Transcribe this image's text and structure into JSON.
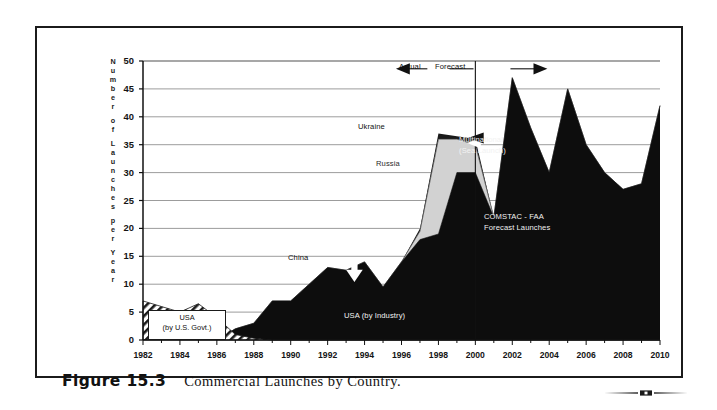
{
  "figure": {
    "number": "Figure 15.3",
    "caption": "Commercial Launches by Country."
  },
  "colors": {
    "ink": "#111111",
    "usa_industry": "#0d0d0d",
    "russia": "#d2d2d2",
    "ukraine": "#1a1a1a",
    "usa_government_hatch": "#ffffff",
    "grid": "#8a8a8a",
    "axis": "#111111"
  },
  "chart_data": {
    "type": "area",
    "title": "Commercial Launches by Country",
    "xlabel": "",
    "ylabel": "Number of Launches per Year",
    "ylabel_letters": [
      "N",
      "u",
      "m",
      "b",
      "e",
      "r",
      "",
      "o",
      "f",
      "",
      "L",
      "a",
      "u",
      "n",
      "c",
      "h",
      "e",
      "s",
      "",
      "p",
      "e",
      "r",
      "",
      "Y",
      "e",
      "a",
      "r"
    ],
    "ylim": [
      0,
      50
    ],
    "yticks": [
      0,
      5,
      10,
      15,
      20,
      25,
      30,
      35,
      40,
      45,
      50
    ],
    "xlim": [
      1982,
      2010
    ],
    "xticks": [
      1982,
      1984,
      1986,
      1988,
      1990,
      1992,
      1994,
      1996,
      1998,
      2000,
      2002,
      2004,
      2006,
      2008,
      2010
    ],
    "grid": true,
    "legend_position": "inline-annotations",
    "x": [
      1982,
      1983,
      1984,
      1985,
      1986,
      1987,
      1988,
      1989,
      1990,
      1991,
      1992,
      1993,
      1994,
      1995,
      1996,
      1997,
      1998,
      1999,
      2000,
      2001,
      2002,
      2003,
      2004,
      2005,
      2006,
      2007,
      2008,
      2009,
      2010
    ],
    "series": [
      {
        "name": "USA (by U.S. Govt.)",
        "style": "diagonal-hatch",
        "values": [
          7,
          6,
          5,
          6.5,
          4,
          1,
          0.3,
          0,
          0,
          0,
          0,
          0,
          0,
          0,
          0,
          0,
          0,
          0,
          0,
          0,
          0,
          0,
          0,
          0,
          0,
          0,
          0,
          0,
          0
        ]
      },
      {
        "name": "USA (by Industry)",
        "style": "solid-black",
        "values": [
          2,
          4,
          4,
          3.5,
          0,
          2,
          3,
          7,
          7,
          10,
          13,
          12.5,
          14,
          9.5,
          14,
          18,
          19,
          30,
          30,
          22,
          47,
          38,
          30,
          45,
          35,
          30,
          27,
          28,
          42
        ]
      },
      {
        "name": "Russia",
        "style": "solid-light-gray",
        "values": [
          0,
          0,
          0,
          0,
          0,
          0,
          0,
          0,
          0,
          0,
          0,
          0,
          0,
          0,
          0,
          1.5,
          17,
          6,
          5,
          0,
          0,
          0,
          0,
          0,
          0,
          0,
          0,
          0,
          0
        ]
      },
      {
        "name": "Ukraine",
        "style": "solid-dark",
        "values": [
          0,
          0,
          0,
          0,
          0,
          0,
          0,
          0,
          0,
          0,
          0,
          0,
          0,
          0,
          0,
          0.5,
          1,
          0.5,
          1,
          0,
          0,
          0,
          0,
          0,
          0,
          0,
          0,
          0,
          0
        ]
      }
    ],
    "stacked_totals": [
      9,
      10,
      9,
      10,
      4,
      3,
      3.3,
      7,
      7,
      10,
      13,
      12.5,
      14,
      9.5,
      14,
      20,
      37,
      36.5,
      36,
      22,
      47,
      38,
      30,
      45,
      35,
      30,
      27,
      28,
      42
    ],
    "annotations": [
      {
        "name": "actual-label",
        "text": "Actual",
        "x": 1997.6,
        "y": 48.6,
        "arrow": "left"
      },
      {
        "name": "forecast-label",
        "text": "Forecast",
        "x": 2000.3,
        "y": 48.6,
        "arrow": "right"
      },
      {
        "name": "divider-2000",
        "text": "",
        "x": 2000,
        "y": 50,
        "kind": "vertical-divider"
      },
      {
        "name": "ukraine-label",
        "text": "Ukraine",
        "x": 1996.7,
        "y": 40.2
      },
      {
        "name": "russia-label",
        "text": "Russia",
        "x": 1998.0,
        "y": 33.0
      },
      {
        "name": "china-label",
        "text": "China",
        "x": 1993.3,
        "y": 14.8,
        "arrow": "down"
      },
      {
        "name": "usa-industry-label",
        "text": "USA (by Industry)",
        "x": 1995.2,
        "y": 5.0
      },
      {
        "name": "usa-gov-label",
        "text": "USA",
        "text2": "(by U.S. Govt.)",
        "x": 1984.0,
        "y": 3.4
      },
      {
        "name": "multinational-label",
        "text": "Multinational",
        "text2": "(Sea Launch)",
        "x": 2000.9,
        "y": 35.4,
        "arrow": "left"
      },
      {
        "name": "comstac-label",
        "text": "COMSTAC - FAA",
        "text2": "Forecast Launches",
        "x": 2003.0,
        "y": 22.6
      }
    ]
  },
  "labels": {
    "actual": "Actual",
    "forecast": "Forecast",
    "ukraine": "Ukraine",
    "russia": "Russia",
    "china": "China",
    "usa_industry": "USA (by Industry)",
    "usa_gov_line1": "USA",
    "usa_gov_line2": "(by U.S. Govt.)",
    "multinational_line1": "Multinational",
    "multinational_line2": "(Sea Launch)",
    "comstac_line1": "COMSTAC - FAA",
    "comstac_line2": "Forecast Launches"
  }
}
